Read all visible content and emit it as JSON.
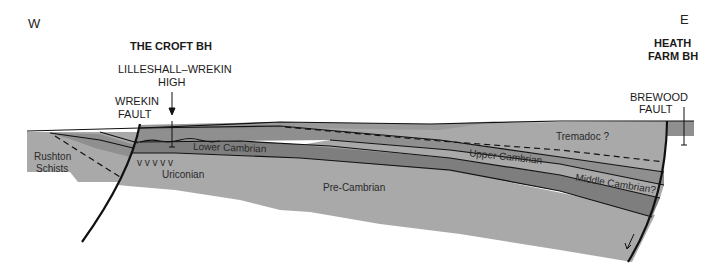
{
  "diagram": {
    "compass": {
      "west": "W",
      "east": "E"
    },
    "boreholes": {
      "croft": "THE CROFT BH",
      "heath_farm_line1": "HEATH",
      "heath_farm_line2": "FARM BH"
    },
    "structures": {
      "high_line1": "LILLESHALL–WREKIN",
      "high_line2": "HIGH",
      "wrekin_line1": "WREKIN",
      "wrekin_line2": "FAULT",
      "brewood_line1": "BREWOOD",
      "brewood_line2": "FAULT"
    },
    "units": {
      "rushton_line1": "Rushton",
      "rushton_line2": "Schists",
      "lower_cambrian": "Lower Cambrian",
      "uriconian": "Uriconian",
      "uriconian_symbols": "v   v   v   v   v",
      "pre_cambrian": "Pre-Cambrian",
      "upper_cambrian": "Upper Cambrian",
      "tremadoc": "Tremadoc ?",
      "middle_cambrian": "Middle Cambrian?"
    },
    "colors": {
      "light_gray": "#a9a9a9",
      "mid_gray": "#8f8f8f",
      "dark_gray": "#7e7e7e",
      "line": "#111111"
    }
  }
}
